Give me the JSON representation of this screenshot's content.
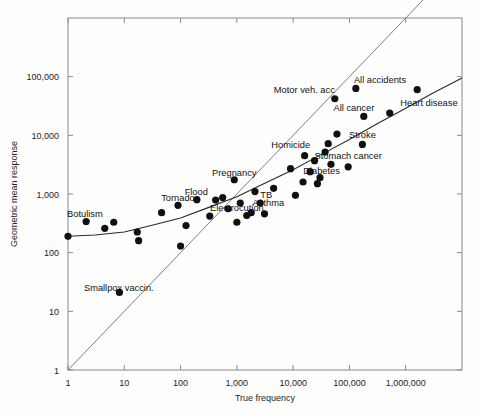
{
  "figure": {
    "background_color": "#fefefe",
    "frame_color": "#8a8a8a",
    "dot_color": "#111111"
  },
  "chart_data": {
    "type": "scatter",
    "title": "",
    "subtitle": "",
    "xlabel": "True frequency",
    "ylabel": "Geometric mean response",
    "xscale": "log",
    "yscale": "log",
    "xlim": [
      1,
      10000000
    ],
    "ylim": [
      1,
      1000000
    ],
    "grid": false,
    "legend": "none",
    "xticklabels": [
      "1",
      "10",
      "100",
      "1,000",
      "10,000",
      "100,000",
      "1,000,000"
    ],
    "xtickvalues": [
      1,
      10,
      100,
      1000,
      10000,
      100000,
      1000000
    ],
    "yticklabels": [
      "1",
      "10",
      "100",
      "1,000",
      "10,000",
      "100,000"
    ],
    "ytickvalues": [
      1,
      10,
      100,
      1000,
      10000,
      100000
    ],
    "annotations": [
      {
        "text": "Botulism",
        "x": 2.0,
        "y": 400
      },
      {
        "text": "Smallpox vaccin.",
        "x": 8.0,
        "y": 22
      },
      {
        "text": "Tornado",
        "x": 90,
        "y": 750
      },
      {
        "text": "Flood",
        "x": 190,
        "y": 950
      },
      {
        "text": "Pregnancy",
        "x": 900,
        "y": 2000
      },
      {
        "text": "Electrocution",
        "x": 1000,
        "y": 520
      },
      {
        "text": "Asthma",
        "x": 1900,
        "y": 620
      },
      {
        "text": "TB",
        "x": 2600,
        "y": 850
      },
      {
        "text": "Homicide",
        "x": 20000,
        "y": 6000
      },
      {
        "text": "Diabetes",
        "x": 32000,
        "y": 2200
      },
      {
        "text": "Stomach cancer",
        "x": 95000,
        "y": 4000
      },
      {
        "text": "Stroke",
        "x": 170000,
        "y": 9000
      },
      {
        "text": "Motor veh. acc",
        "x": 55000,
        "y": 52000
      },
      {
        "text": "All cancer",
        "x": 120000,
        "y": 26000
      },
      {
        "text": "All accidents",
        "x": 120000,
        "y": 78000
      },
      {
        "text": "Heart disease",
        "x": 800000,
        "y": 32000
      }
    ],
    "points": [
      {
        "x": 1.0,
        "y": 190,
        "label": ""
      },
      {
        "x": 2.1,
        "y": 340,
        "label": "Botulism"
      },
      {
        "x": 4.5,
        "y": 260,
        "label": ""
      },
      {
        "x": 6.5,
        "y": 330,
        "label": ""
      },
      {
        "x": 8.2,
        "y": 21,
        "label": "Smallpox vaccin."
      },
      {
        "x": 17,
        "y": 225,
        "label": ""
      },
      {
        "x": 18,
        "y": 160,
        "label": ""
      },
      {
        "x": 46,
        "y": 480,
        "label": ""
      },
      {
        "x": 90,
        "y": 640,
        "label": "Tornado"
      },
      {
        "x": 100,
        "y": 130,
        "label": ""
      },
      {
        "x": 125,
        "y": 290,
        "label": ""
      },
      {
        "x": 195,
        "y": 800,
        "label": "Flood"
      },
      {
        "x": 330,
        "y": 420,
        "label": ""
      },
      {
        "x": 420,
        "y": 790,
        "label": ""
      },
      {
        "x": 560,
        "y": 870,
        "label": ""
      },
      {
        "x": 700,
        "y": 560,
        "label": ""
      },
      {
        "x": 900,
        "y": 1750,
        "label": "Pregnancy"
      },
      {
        "x": 1000,
        "y": 330,
        "label": "Electrocution"
      },
      {
        "x": 1150,
        "y": 700,
        "label": ""
      },
      {
        "x": 1500,
        "y": 430,
        "label": ""
      },
      {
        "x": 1800,
        "y": 480,
        "label": "Asthma"
      },
      {
        "x": 2100,
        "y": 1100,
        "label": ""
      },
      {
        "x": 2600,
        "y": 700,
        "label": "TB"
      },
      {
        "x": 3100,
        "y": 460,
        "label": ""
      },
      {
        "x": 4500,
        "y": 1250,
        "label": ""
      },
      {
        "x": 9000,
        "y": 2700,
        "label": ""
      },
      {
        "x": 11000,
        "y": 950,
        "label": ""
      },
      {
        "x": 15000,
        "y": 1600,
        "label": ""
      },
      {
        "x": 16000,
        "y": 4500,
        "label": ""
      },
      {
        "x": 20000,
        "y": 2400,
        "label": ""
      },
      {
        "x": 24000,
        "y": 3700,
        "label": ""
      },
      {
        "x": 27000,
        "y": 1500,
        "label": ""
      },
      {
        "x": 30000,
        "y": 1900,
        "label": ""
      },
      {
        "x": 37000,
        "y": 5200,
        "label": ""
      },
      {
        "x": 42000,
        "y": 7200,
        "label": "Homicide"
      },
      {
        "x": 47000,
        "y": 3200,
        "label": ""
      },
      {
        "x": 55000,
        "y": 42000,
        "label": "Motor veh. acc"
      },
      {
        "x": 60000,
        "y": 10500,
        "label": ""
      },
      {
        "x": 95000,
        "y": 2900,
        "label": "Stomach cancer"
      },
      {
        "x": 130000,
        "y": 63000,
        "label": "All accidents"
      },
      {
        "x": 170000,
        "y": 7000,
        "label": "Stroke"
      },
      {
        "x": 180000,
        "y": 21000,
        "label": "All cancer"
      },
      {
        "x": 520000,
        "y": 24000,
        "label": "Heart disease"
      },
      {
        "x": 1600000,
        "y": 60000,
        "label": ""
      }
    ],
    "lines": [
      {
        "name": "identity-line",
        "description": "diagonal y = x reference line",
        "style": "thin-solid",
        "points": [
          [
            1,
            1
          ],
          [
            10000000,
            10000000
          ]
        ]
      },
      {
        "name": "fitted-curve",
        "description": "fitted regression curve through the judgment data",
        "style": "solid",
        "points": [
          [
            1,
            190
          ],
          [
            3,
            200
          ],
          [
            10,
            225
          ],
          [
            30,
            290
          ],
          [
            100,
            390
          ],
          [
            300,
            580
          ],
          [
            1000,
            900
          ],
          [
            3000,
            1500
          ],
          [
            10000,
            2600
          ],
          [
            30000,
            4600
          ],
          [
            100000,
            8500
          ],
          [
            300000,
            15500
          ],
          [
            1000000,
            29000
          ],
          [
            3000000,
            52000
          ],
          [
            10000000,
            95000
          ]
        ]
      }
    ]
  }
}
